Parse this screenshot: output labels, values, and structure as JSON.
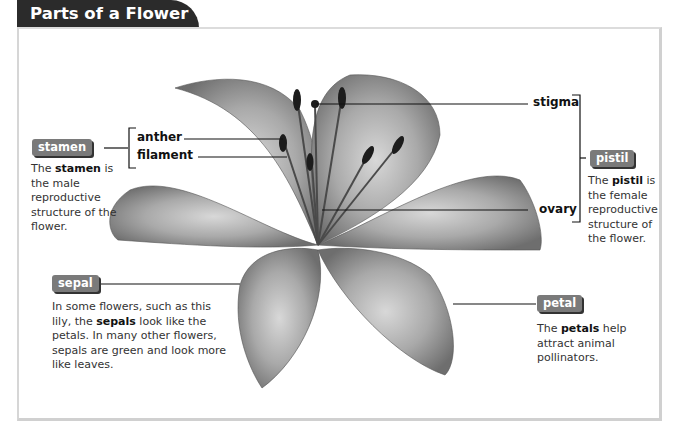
{
  "title": "Parts of a Flower",
  "labels": {
    "anther": "anther",
    "filament": "filament",
    "stigma": "stigma",
    "ovary": "ovary"
  },
  "callouts": {
    "stamen": {
      "chip": "stamen",
      "desc_pre": "The ",
      "desc_bold": "stamen",
      "desc_post": " is the male reproductive structure of the flower."
    },
    "pistil": {
      "chip": "pistil",
      "desc_pre": "The ",
      "desc_bold": "pistil",
      "desc_post": " is the female reproductive structure of the flower."
    },
    "sepal": {
      "chip": "sepal",
      "desc_pre": "In some flowers, such as this lily, the ",
      "desc_bold": "sepals",
      "desc_post": " look like the petals. In many other flowers, sepals are green and look more like leaves."
    },
    "petal": {
      "chip": "petal",
      "desc_pre": "The ",
      "desc_bold": "petals",
      "desc_post": " help attract animal pollinators."
    }
  },
  "colors": {
    "title_bg": "#2b2b2b",
    "chip_bg": "#7a7a7a",
    "frame": "#d0d0d0"
  }
}
